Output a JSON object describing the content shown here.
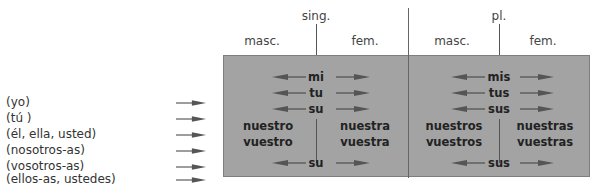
{
  "headers": {
    "singular": "sing.",
    "plural": "pl.",
    "sing_masc": "masc.",
    "sing_fem": "fem.",
    "pl_masc": "masc.",
    "pl_fem": "fem."
  },
  "pronouns": [
    "(yo)",
    "(tú )",
    "(él, ella, usted)",
    "(nosotros-as)",
    "(vosotros-as)",
    "(ellos-as, ustedes)"
  ],
  "singular": {
    "shared": [
      "mi",
      "tu",
      "su"
    ],
    "masc": [
      "nuestro",
      "vuestro"
    ],
    "fem": [
      "nuestra",
      "vuestra"
    ],
    "last": "su"
  },
  "plural": {
    "shared": [
      "mis",
      "tus",
      "sus"
    ],
    "masc": [
      "nuestros",
      "vuestros"
    ],
    "fem": [
      "nuestras",
      "vuestras"
    ],
    "last": "sus"
  },
  "colors": {
    "box_fill": "#a3a3a3",
    "box_border": "#7e7e7e",
    "arrow": "#555555"
  }
}
